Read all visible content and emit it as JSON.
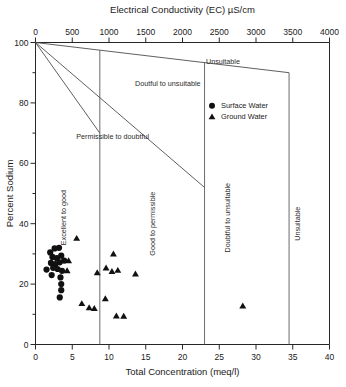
{
  "chart_data": {
    "type": "scatter",
    "title": "",
    "xlabel": "Total Concentration (meq/l)",
    "ylabel": "Percent Sodium",
    "top_axis_label": "Electrical Conductivity (EC) µS/cm",
    "xlim": [
      0,
      40
    ],
    "ylim": [
      0,
      100
    ],
    "top_xlim": [
      0,
      4000
    ],
    "xticks": [
      0,
      5,
      10,
      15,
      20,
      25,
      30,
      35,
      40
    ],
    "xticklabels": [
      "0",
      "5",
      "10",
      "15",
      "20",
      "25",
      "30",
      "35",
      "40"
    ],
    "yticks": [
      0,
      20,
      40,
      60,
      80,
      100
    ],
    "yticklabels": [
      "0",
      "20",
      "40",
      "60",
      "80",
      "100"
    ],
    "y_minor_ticks": [
      10,
      30,
      50,
      70,
      90
    ],
    "top_xticks": [
      0,
      500,
      1000,
      1500,
      2000,
      2500,
      3000,
      3500,
      4000
    ],
    "top_xticklabels": [
      "0",
      "500",
      "1000",
      "1500",
      "2000",
      "2500",
      "3000",
      "3500",
      "4000"
    ],
    "grid": false,
    "legend_position": "upper-right-inside",
    "legend": [
      {
        "name": "Surface Water",
        "marker": "circle"
      },
      {
        "name": "Ground Water",
        "marker": "triangle"
      }
    ],
    "zone_labels": [
      {
        "text": "Unsuitable",
        "orientation": "horizontal",
        "x": 25.5,
        "y": 93
      },
      {
        "text": "Doutful to unsuitable",
        "orientation": "horizontal",
        "x": 18.0,
        "y": 85.5
      },
      {
        "text": "Permissible to doubtful",
        "orientation": "horizontal",
        "x": 10.5,
        "y": 68
      },
      {
        "text": "Excellent to good",
        "orientation": "vertical",
        "x": 4.2,
        "y": 42
      },
      {
        "text": "Good to permissible",
        "orientation": "vertical",
        "x": 16.2,
        "y": 40
      },
      {
        "text": "Doubtful to unsuitable",
        "orientation": "vertical",
        "x": 26.5,
        "y": 42
      },
      {
        "text": "Unsuitable",
        "orientation": "vertical",
        "x": 36.0,
        "y": 40
      }
    ],
    "boundary_lines": [
      {
        "name": "excellent-good-upper",
        "points": [
          [
            0,
            100
          ],
          [
            34.5,
            90
          ]
        ]
      },
      {
        "name": "good-permissible-mid",
        "points": [
          [
            0,
            100
          ],
          [
            23.0,
            52
          ]
        ]
      },
      {
        "name": "permissible-doubtful-lower",
        "points": [
          [
            0,
            100
          ],
          [
            8.75,
            70
          ]
        ]
      }
    ],
    "dividers": [
      {
        "name": "divider-8-75",
        "x": 8.75
      },
      {
        "name": "divider-23",
        "x": 23.0
      },
      {
        "name": "divider-34-5",
        "x": 34.5
      }
    ],
    "series": [
      {
        "name": "Surface Water",
        "marker": "circle",
        "points": [
          [
            2.0,
            30.5
          ],
          [
            2.6,
            31.8
          ],
          [
            3.2,
            32.0
          ],
          [
            2.3,
            29.0
          ],
          [
            2.9,
            28.6
          ],
          [
            3.5,
            29.4
          ],
          [
            2.1,
            27.0
          ],
          [
            2.7,
            26.6
          ],
          [
            3.3,
            27.2
          ],
          [
            3.9,
            27.8
          ],
          [
            1.5,
            24.8
          ],
          [
            2.4,
            25.4
          ],
          [
            3.0,
            25.0
          ],
          [
            3.6,
            24.4
          ],
          [
            2.2,
            23.0
          ],
          [
            3.4,
            22.2
          ],
          [
            3.5,
            20.0
          ],
          [
            3.5,
            18.0
          ],
          [
            3.3,
            15.6
          ]
        ]
      },
      {
        "name": "Ground Water",
        "marker": "triangle",
        "points": [
          [
            5.6,
            35.2
          ],
          [
            4.5,
            27.8
          ],
          [
            4.3,
            24.5
          ],
          [
            10.6,
            30.0
          ],
          [
            9.6,
            25.4
          ],
          [
            10.4,
            24.2
          ],
          [
            11.2,
            24.6
          ],
          [
            8.4,
            23.8
          ],
          [
            13.6,
            23.4
          ],
          [
            6.3,
            13.6
          ],
          [
            7.3,
            12.2
          ],
          [
            8.0,
            12.0
          ],
          [
            9.5,
            15.2
          ],
          [
            11.0,
            9.5
          ],
          [
            12.0,
            9.4
          ],
          [
            28.2,
            12.8
          ]
        ]
      }
    ]
  },
  "axes": {
    "top_title": "Electrical Conductivity (EC) µS/cm",
    "bottom_title": "Total Concentration (meq/l)",
    "left_title": "Percent Sodium"
  }
}
